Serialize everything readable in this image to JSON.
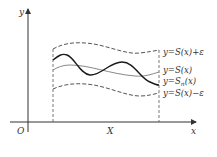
{
  "diagram": {
    "axes": {
      "x_label": "x",
      "y_label": "y",
      "origin_label": "O",
      "interval_label": "X"
    },
    "curves": [
      {
        "name": "upper-bound",
        "label": "y=S(x)+ε",
        "style": "dashed"
      },
      {
        "name": "limit-function",
        "label": "y=S(x)",
        "style": "solid-gray"
      },
      {
        "name": "partial-sum",
        "label_prefix": "y=S",
        "label_sub": "n",
        "label_suffix": "(x)",
        "style": "solid-black"
      },
      {
        "name": "lower-bound",
        "label": "y=S(x)−ε",
        "style": "dashed"
      }
    ],
    "colors": {
      "axis": "#333333",
      "dashed": "#555555",
      "limit": "#888888",
      "partial": "#1a1a1a"
    }
  }
}
